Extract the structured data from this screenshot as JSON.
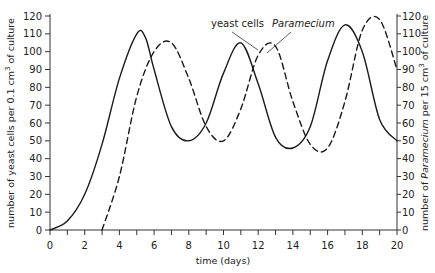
{
  "chart_data": {
    "type": "line",
    "title": "",
    "xlabel": "time (days)",
    "ylabel": "number of yeast cells per 0.1 cm³ of culture",
    "ylabel_right": "number of Paramecium per 15 cm³ of culture",
    "xlim": [
      0,
      20
    ],
    "ylim": [
      0,
      120
    ],
    "ylim_right": [
      0,
      120
    ],
    "x_ticks": [
      0,
      2,
      4,
      6,
      8,
      10,
      12,
      14,
      16,
      18,
      20
    ],
    "y_ticks": [
      0,
      10,
      20,
      30,
      40,
      50,
      60,
      70,
      80,
      90,
      100,
      110,
      120
    ],
    "y_ticks_right": [
      0,
      10,
      20,
      30,
      40,
      50,
      60,
      70,
      80,
      90,
      100,
      110,
      120
    ],
    "grid": false,
    "series": [
      {
        "name": "yeast cells",
        "style": "solid",
        "axis": "left",
        "x": [
          0,
          1,
          2,
          3,
          4,
          5,
          5.5,
          6,
          7,
          8,
          9,
          10,
          11,
          12,
          13,
          14,
          15,
          16,
          17,
          18,
          19,
          20
        ],
        "values": [
          0,
          5,
          20,
          48,
          85,
          110,
          108,
          90,
          58,
          50,
          60,
          88,
          105,
          82,
          52,
          46,
          58,
          95,
          115,
          100,
          62,
          50
        ]
      },
      {
        "name": "Paramecium",
        "style": "dashed",
        "axis": "right",
        "x": [
          3,
          4,
          5,
          6,
          7,
          8,
          9,
          10,
          11,
          12,
          13,
          14,
          15,
          16,
          17,
          18,
          19,
          20
        ],
        "values": [
          0,
          30,
          75,
          100,
          105,
          85,
          58,
          50,
          68,
          98,
          103,
          72,
          48,
          46,
          72,
          112,
          118,
          90
        ]
      }
    ],
    "annotations": [
      {
        "text": "yeast cells",
        "points_to": "yeast cells"
      },
      {
        "text": "Paramecium",
        "points_to": "Paramecium",
        "italic": true
      }
    ]
  },
  "labels": {
    "xlabel": "time (days)",
    "ylabel_left_prefix": "number of yeast cells per 0.1 cm",
    "ylabel_left_suffix": " of culture",
    "ylabel_right_prefix": "number of ",
    "ylabel_right_italic": "Paramecium",
    "ylabel_right_mid": " per 15 cm",
    "ylabel_right_suffix": " of culture",
    "superscript": "3",
    "legend_yeast": "yeast cells",
    "legend_paramecium": "Paramecium"
  }
}
